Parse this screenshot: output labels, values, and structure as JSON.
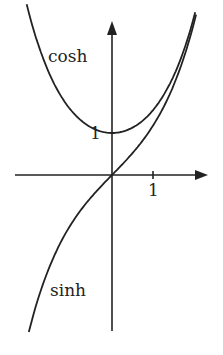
{
  "chart_data": {
    "type": "line",
    "title": "",
    "xlabel": "",
    "ylabel": "",
    "x_ticks": [
      "1"
    ],
    "y_ticks": [
      "1"
    ],
    "xlim": [
      -2.1,
      2.3
    ],
    "ylim": [
      -3.8,
      3.8
    ],
    "grid": false,
    "legend": "inline labels",
    "series": [
      {
        "name": "cosh",
        "function": "cosh(x)",
        "x": [
          -2,
          -1.5,
          -1,
          -0.5,
          0,
          0.5,
          1,
          1.5,
          2
        ],
        "values": [
          3.76,
          2.35,
          1.54,
          1.13,
          1.0,
          1.13,
          1.54,
          2.35,
          3.76
        ]
      },
      {
        "name": "sinh",
        "function": "sinh(x)",
        "x": [
          -2,
          -1.5,
          -1,
          -0.5,
          0,
          0.5,
          1,
          1.5,
          2
        ],
        "values": [
          -3.63,
          -2.13,
          -1.18,
          -0.52,
          0.0,
          0.52,
          1.18,
          2.13,
          3.63
        ]
      }
    ]
  },
  "labels": {
    "cosh": "cosh",
    "sinh": "sinh",
    "y_one": "1",
    "x_one": "1"
  },
  "colors": {
    "ink": "#222222",
    "background": "#ffffff"
  }
}
